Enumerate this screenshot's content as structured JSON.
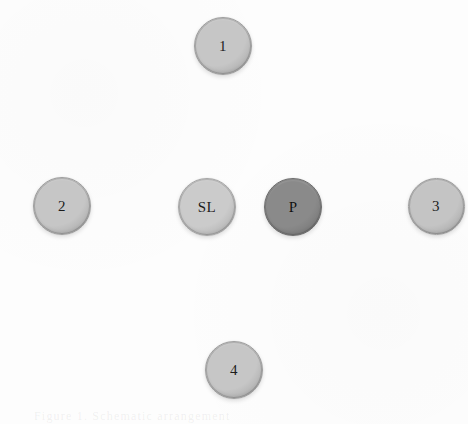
{
  "figure": {
    "background_color": "#fdfdfd",
    "width": 468,
    "height": 424,
    "caption_ghost": "Figure 1. Schematic arrangement"
  },
  "diagram": {
    "type": "node-diagram",
    "layout": "diamond-cross",
    "node_count": 6,
    "nodes": [
      {
        "id": "node-1",
        "label": "1",
        "position": "top-center",
        "cx": 223,
        "cy": 46,
        "diameter": 58,
        "fill": "#c6c6c6",
        "rim": "#9e9e9e",
        "emphasis": "normal"
      },
      {
        "id": "node-2",
        "label": "2",
        "position": "middle-left",
        "cx": 62,
        "cy": 206,
        "diameter": 58,
        "fill": "#c6c6c6",
        "rim": "#9e9e9e",
        "emphasis": "normal"
      },
      {
        "id": "node-sl",
        "label": "SL",
        "position": "middle-center-left",
        "cx": 207,
        "cy": 207,
        "diameter": 58,
        "fill": "#cbcbcb",
        "rim": "#a6a6a6",
        "emphasis": "normal"
      },
      {
        "id": "node-p",
        "label": "P",
        "position": "middle-center-right",
        "cx": 293,
        "cy": 207,
        "diameter": 58,
        "fill": "#8a8a8a",
        "rim": "#6d6d6d",
        "emphasis": "highlighted"
      },
      {
        "id": "node-3",
        "label": "3",
        "position": "middle-right",
        "cx": 436,
        "cy": 206,
        "diameter": 57,
        "fill": "#c4c4c4",
        "rim": "#9c9c9c",
        "emphasis": "normal"
      },
      {
        "id": "node-4",
        "label": "4",
        "position": "bottom-center",
        "cx": 234,
        "cy": 370,
        "diameter": 58,
        "fill": "#c6c6c6",
        "rim": "#9e9e9e",
        "emphasis": "normal"
      }
    ]
  }
}
